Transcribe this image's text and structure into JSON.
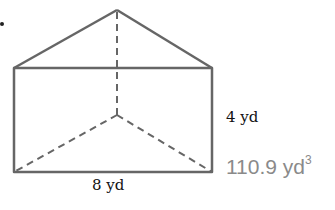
{
  "figure": {
    "type": "triangular-prism",
    "height_label": "4 yd",
    "base_label": "8 yd",
    "answer": {
      "value": "110.9 yd",
      "exponent": "3"
    }
  },
  "colors": {
    "edge": "#666666",
    "answer": "#8a8a8a"
  }
}
